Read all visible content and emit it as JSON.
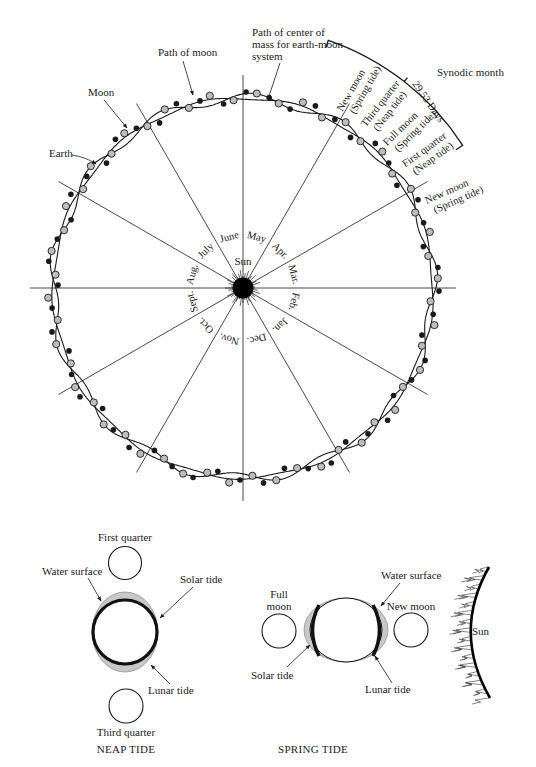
{
  "orbit_diagram": {
    "sun_label": "Sun",
    "months": [
      "Mar.",
      "Apr.",
      "May",
      "June",
      "July",
      "Aug.",
      "Sept.",
      "Oct.",
      "Nov.",
      "Dec.",
      "Jan.",
      "Feb."
    ],
    "callouts": {
      "path_of_moon": "Path of moon",
      "center_of_mass": [
        "Path of center of",
        "mass for earth-moon",
        "system"
      ],
      "moon": "Moon",
      "earth": "Earth"
    },
    "synodic": {
      "title": "Synodic month",
      "days": "29.53 Days",
      "phases": [
        [
          "New moon",
          "(Spring tide)"
        ],
        [
          "Third quarter",
          "(Neap tide)"
        ],
        [
          "Full moon",
          "(Spring tide)"
        ],
        [
          "First quarter",
          "(Neap tide)"
        ],
        [
          "New moon",
          "(Spring tide)"
        ]
      ]
    }
  },
  "neap_tide": {
    "caption": "NEAP TIDE",
    "first_quarter": "First quarter",
    "third_quarter": "Third quarter",
    "water_surface": "Water surface",
    "solar_tide": "Solar tide",
    "lunar_tide": "Lunar tide"
  },
  "spring_tide": {
    "caption": "SPRING TIDE",
    "full_moon": [
      "Full",
      "moon"
    ],
    "new_moon": "New moon",
    "water_surface": "Water surface",
    "solar_tide": "Solar tide",
    "lunar_tide": "Lunar tide",
    "sun": "Sun"
  },
  "colors": {
    "ink": "#1a1a1a",
    "earth_fill": "#bdbdbd",
    "water_fill": "#c8c8c8"
  }
}
